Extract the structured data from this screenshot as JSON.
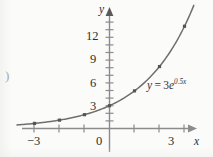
{
  "chart_data": {
    "type": "line",
    "title": "",
    "subtitle": "",
    "function_label": "y = 3e^{0.5x}",
    "function_parts": {
      "lhs": "y",
      "equals": "=",
      "coefficient": "3",
      "base": "e",
      "exponent": "0.5x"
    },
    "xlabel": "x",
    "ylabel": "y",
    "xlim": [
      -3.7,
      3.6
    ],
    "ylim": [
      -1.2,
      15.6
    ],
    "x_ticks": [
      -3,
      -2,
      -1,
      0,
      1,
      2,
      3
    ],
    "x_tick_labels": [
      "−3",
      "",
      "",
      "0",
      "",
      "",
      "3"
    ],
    "y_ticks": [
      1,
      2,
      3,
      4,
      5,
      6,
      7,
      8,
      9,
      10,
      11,
      12,
      13,
      14,
      15
    ],
    "y_tick_labels": [
      "",
      "",
      "3",
      "",
      "",
      "6",
      "",
      "",
      "9",
      "",
      "",
      "12",
      "",
      "",
      ""
    ],
    "grid": false,
    "legend": "none",
    "axis_arrows": [
      "x-positive",
      "y-positive"
    ],
    "x": [
      -3,
      -2,
      -1,
      0,
      1,
      2,
      3
    ],
    "values": [
      0.67,
      1.1,
      1.82,
      3.0,
      4.95,
      8.15,
      13.45
    ],
    "markers": true,
    "marker_shape": "square",
    "series": [
      {
        "name": "y = 3e^{0.5x}",
        "x": [
          -3,
          -2,
          -1,
          0,
          1,
          2,
          3
        ],
        "values": [
          0.67,
          1.1,
          1.82,
          3.0,
          4.95,
          8.15,
          13.45
        ]
      }
    ],
    "colors": {
      "curve": "#6f6f6f",
      "axis": "#8c8c8c",
      "marker": "#555555",
      "text": "#2e2e2e",
      "background": "#fbfbfa"
    }
  },
  "labels": {
    "y_12": "12",
    "y_9": "9",
    "y_6": "6",
    "y_3": "3",
    "x_neg3": "−3",
    "x_0": "0",
    "x_3": "3",
    "x_axis_name": "x",
    "y_axis_name": "y"
  },
  "equation": {
    "lhs": "y",
    "equals": "=",
    "coefficient": "3",
    "base": "e",
    "exponent": "0.5x"
  },
  "artifacts": {
    "edge_mark": ")"
  }
}
